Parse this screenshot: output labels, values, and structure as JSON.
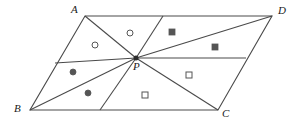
{
  "figure": {
    "type": "geometry-diagram",
    "width": 298,
    "height": 123,
    "background_color": "#ffffff",
    "line_color": "#4a4a4a",
    "marker_color": "#555555",
    "label_color": "#1a1a1a"
  },
  "vertices": [
    {
      "name": "A",
      "label": "A",
      "x": 85,
      "y": 16,
      "label_x": 71,
      "label_y": 4
    },
    {
      "name": "B",
      "label": "B",
      "x": 30,
      "y": 110,
      "label_x": 14,
      "label_y": 103
    },
    {
      "name": "C",
      "label": "C",
      "x": 218,
      "y": 110,
      "label_x": 222,
      "label_y": 108
    },
    {
      "name": "D",
      "label": "D",
      "x": 272,
      "y": 16,
      "label_x": 278,
      "label_y": 5
    },
    {
      "name": "P",
      "label": "P",
      "x": 136,
      "y": 58,
      "label_x": 133,
      "label_y": 61
    }
  ],
  "outline": {
    "name": "parallelogram-outline",
    "points": "85,16 272,16 218,110 30,110"
  },
  "segments": [
    {
      "name": "segment-P-A",
      "x1": 136,
      "y1": 58,
      "x2": 85,
      "y2": 16
    },
    {
      "name": "segment-P-B",
      "x1": 136,
      "y1": 58,
      "x2": 30,
      "y2": 110
    },
    {
      "name": "segment-P-C",
      "x1": 136,
      "y1": 58,
      "x2": 218,
      "y2": 110
    },
    {
      "name": "segment-P-D",
      "x1": 136,
      "y1": 58,
      "x2": 272,
      "y2": 16
    },
    {
      "name": "segment-P-top-edge",
      "x1": 136,
      "y1": 58,
      "x2": 163,
      "y2": 16
    },
    {
      "name": "segment-P-bottom-edge",
      "x1": 136,
      "y1": 58,
      "x2": 100,
      "y2": 110
    },
    {
      "name": "segment-P-left-edge",
      "x1": 136,
      "y1": 58,
      "x2": 55,
      "y2": 63
    },
    {
      "name": "segment-P-right-edge",
      "x1": 136,
      "y1": 58,
      "x2": 246,
      "y2": 58
    }
  ],
  "markers": [
    {
      "name": "open-circle-marker-1",
      "shape": "open-circle",
      "x": 95,
      "y": 45,
      "size": 6
    },
    {
      "name": "open-circle-marker-2",
      "shape": "open-circle",
      "x": 130,
      "y": 33,
      "size": 6
    },
    {
      "name": "filled-square-marker-1",
      "shape": "filled-square",
      "x": 172,
      "y": 32,
      "size": 6
    },
    {
      "name": "filled-square-marker-2",
      "shape": "filled-square",
      "x": 215,
      "y": 47,
      "size": 6
    },
    {
      "name": "filled-circle-marker-1",
      "shape": "filled-circle",
      "x": 73,
      "y": 72,
      "size": 6
    },
    {
      "name": "filled-circle-marker-2",
      "shape": "filled-circle",
      "x": 88,
      "y": 93,
      "size": 6
    },
    {
      "name": "open-square-marker-1",
      "shape": "open-square",
      "x": 189,
      "y": 75,
      "size": 6
    },
    {
      "name": "open-square-marker-2",
      "shape": "open-square",
      "x": 145,
      "y": 95,
      "size": 6
    }
  ],
  "point_marker": {
    "name": "point-P-dot",
    "x": 136,
    "y": 58,
    "size": 5
  }
}
